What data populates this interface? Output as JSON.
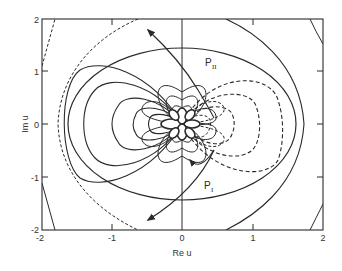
{
  "figure": {
    "xlabel": "Re u",
    "ylabel": "Im u",
    "xticks": [
      "-2",
      "-1",
      "0",
      "1",
      "2"
    ],
    "yticks": [
      "2",
      "1",
      "0",
      "-1",
      "-2"
    ],
    "xlim": [
      -2,
      2
    ],
    "ylim": [
      -2,
      2
    ],
    "annotations": {
      "upper": "P",
      "upper_sub": "II",
      "lower": "P",
      "lower_sub": "I"
    },
    "colors": {
      "line": "#2a2a2a",
      "background": "#ffffff"
    }
  }
}
